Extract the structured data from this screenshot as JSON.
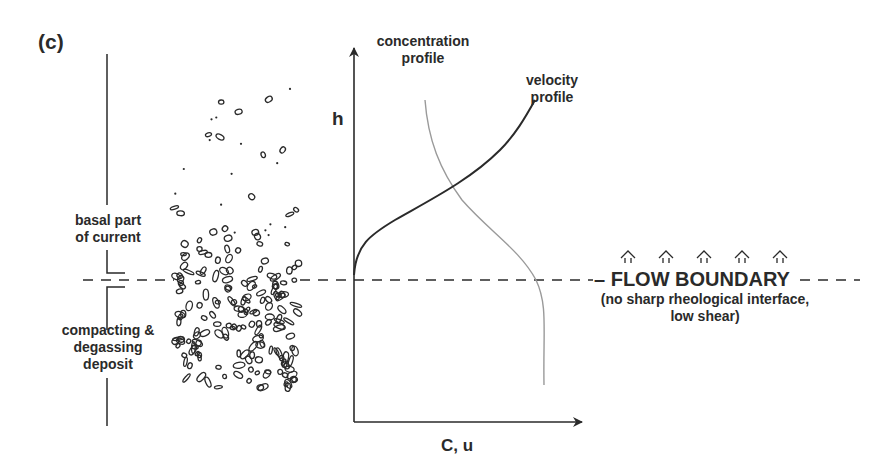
{
  "panel_label": "(c)",
  "left_labels": {
    "upper": [
      "basal part",
      "of current"
    ],
    "lower": [
      "compacting &",
      "degassing",
      "deposit"
    ]
  },
  "axes": {
    "y_label": "h",
    "x_label": "C, u"
  },
  "curves": {
    "concentration": {
      "label": [
        "concentration",
        "profile"
      ],
      "color": "#9a9a9a"
    },
    "velocity": {
      "label": [
        "velocity",
        "profile"
      ],
      "color": "#2a2a2a"
    }
  },
  "flow_boundary": {
    "title": "FLOW BOUNDARY",
    "note": [
      "(no sharp rheological interface,",
      "low shear)"
    ],
    "arrow_count": 5
  },
  "colors": {
    "ink": "#2a2a2a",
    "light_curve": "#9a9a9a",
    "background": "#ffffff"
  }
}
